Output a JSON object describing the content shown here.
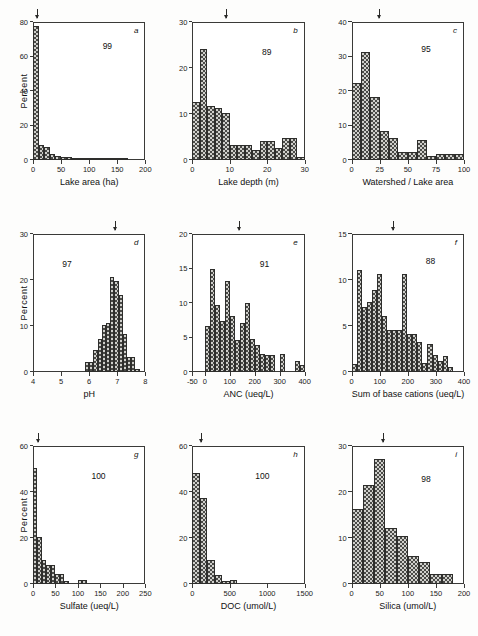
{
  "figure": {
    "type": "multi-panel-histogram-figure",
    "panels": 9
  },
  "chart_data": [
    {
      "type": "bar",
      "panel": "a",
      "panel_label": "a",
      "n_label": "99",
      "title": "",
      "xlabel": "Lake area (ha)",
      "ylabel": "Percent",
      "xlim": [
        0,
        200
      ],
      "ylim": [
        0,
        80
      ],
      "xticks": [
        0,
        50,
        100,
        150,
        200
      ],
      "yticks": [
        0,
        20,
        40,
        60,
        80
      ],
      "bin_width": 10,
      "grid": false,
      "median_marker": 8,
      "bin_starts": [
        0,
        10,
        20,
        30,
        40,
        50,
        60,
        70,
        80,
        90,
        100,
        110,
        120,
        130,
        140,
        150,
        160,
        170,
        180,
        190
      ],
      "values": [
        77,
        8,
        7,
        3,
        1.5,
        1,
        1,
        0.5,
        0.5,
        0.5,
        0.5,
        0.5,
        0.5,
        0.5,
        0.5,
        0.5,
        0.5,
        0,
        0,
        0
      ]
    },
    {
      "type": "bar",
      "panel": "b",
      "panel_label": "b",
      "n_label": "89",
      "title": "",
      "xlabel": "Lake depth (m)",
      "ylabel": "",
      "xlim": [
        0,
        30
      ],
      "ylim": [
        0,
        30
      ],
      "xticks": [
        0,
        10,
        20,
        30
      ],
      "yticks": [
        0,
        10,
        20,
        30
      ],
      "bin_width": 2,
      "grid": false,
      "median_marker": 9,
      "bin_starts": [
        0,
        2,
        4,
        6,
        8,
        10,
        12,
        14,
        16,
        18,
        20,
        22,
        24,
        26,
        28
      ],
      "values": [
        12.5,
        24,
        11.5,
        11,
        10,
        3,
        3,
        3,
        2,
        4,
        4,
        2.5,
        4.5,
        4.5,
        0.5
      ]
    },
    {
      "type": "bar",
      "panel": "c",
      "panel_label": "c",
      "n_label": "95",
      "title": "",
      "xlabel": "Watershed / Lake area",
      "ylabel": "",
      "xlim": [
        0,
        100
      ],
      "ylim": [
        0,
        40
      ],
      "xticks": [
        0,
        25,
        50,
        75,
        100
      ],
      "yticks": [
        0,
        10,
        20,
        30,
        40
      ],
      "bin_width": 8.33,
      "grid": false,
      "median_marker": 25,
      "bin_starts": [
        0,
        8.33,
        16.67,
        25,
        33.33,
        41.67,
        50,
        58.33,
        66.67,
        75,
        83.33,
        91.67
      ],
      "values": [
        22,
        31,
        18,
        8,
        6,
        2,
        2,
        5.5,
        1,
        1.5,
        1.5,
        1.5
      ]
    },
    {
      "type": "bar",
      "panel": "d",
      "panel_label": "d",
      "n_label": "97",
      "title": "",
      "xlabel": "pH",
      "ylabel": "Percent",
      "xlim": [
        4,
        8
      ],
      "ylim": [
        0,
        30
      ],
      "xticks": [
        4,
        5,
        6,
        7,
        8
      ],
      "yticks": [
        0,
        10,
        20,
        30
      ],
      "bin_width": 0.15,
      "grid": false,
      "median_marker": 6.95,
      "bin_starts": [
        5.85,
        6.0,
        6.15,
        6.3,
        6.45,
        6.6,
        6.75,
        6.9,
        7.05,
        7.2,
        7.35,
        7.5,
        7.65
      ],
      "values": [
        2,
        2,
        4.5,
        7,
        10,
        10.5,
        20.5,
        19.5,
        16.5,
        8,
        3,
        3,
        0.5
      ]
    },
    {
      "type": "bar",
      "panel": "e",
      "panel_label": "e",
      "n_label": "91",
      "title": "",
      "xlabel": "ANC (ueq/L)",
      "ylabel": "",
      "xlim": [
        -50,
        400
      ],
      "ylim": [
        0,
        20
      ],
      "xticks": [
        -50,
        0,
        100,
        200,
        300,
        400
      ],
      "yticks": [
        0,
        5,
        10,
        15,
        20
      ],
      "bin_width": 20,
      "grid": false,
      "median_marker": 140,
      "bin_starts": [
        0,
        20,
        40,
        60,
        80,
        100,
        120,
        140,
        160,
        180,
        200,
        220,
        240,
        260,
        280,
        300,
        320,
        340,
        360,
        380
      ],
      "values": [
        6.5,
        14.8,
        9.5,
        7.2,
        13,
        8,
        4.5,
        7,
        9.8,
        4.7,
        3.8,
        2.5,
        2.3,
        2.3,
        0,
        2.5,
        0,
        0,
        1.5,
        0.8
      ]
    },
    {
      "type": "bar",
      "panel": "f",
      "panel_label": "f",
      "n_label": "88",
      "title": "",
      "xlabel": "Sum of base cations (ueq/L)",
      "ylabel": "",
      "xlim": [
        0,
        400
      ],
      "ylim": [
        0,
        15
      ],
      "xticks": [
        0,
        100,
        200,
        300,
        400
      ],
      "yticks": [
        0,
        5,
        10,
        15
      ],
      "bin_width": 18,
      "grid": false,
      "median_marker": 150,
      "bin_starts": [
        0,
        18,
        36,
        54,
        72,
        90,
        108,
        126,
        144,
        162,
        180,
        198,
        216,
        234,
        252,
        270,
        288,
        306,
        324,
        342
      ],
      "values": [
        0.8,
        11,
        7,
        7.5,
        8.8,
        10.5,
        6,
        4.5,
        4.5,
        4.5,
        10.5,
        4,
        4,
        3.2,
        0.9,
        2.9,
        1.7,
        1.1,
        1.6,
        0.4
      ]
    },
    {
      "type": "bar",
      "panel": "g",
      "panel_label": "g",
      "n_label": "100",
      "title": "",
      "xlabel": "Sulfate (ueq/L)",
      "ylabel": "Percent",
      "xlim": [
        0,
        250
      ],
      "ylim": [
        0,
        60
      ],
      "xticks": [
        0,
        50,
        100,
        150,
        200,
        250
      ],
      "yticks": [
        0,
        20,
        40,
        60
      ],
      "bin_width": 10,
      "grid": false,
      "median_marker": 12,
      "bin_starts": [
        0,
        10,
        20,
        30,
        40,
        50,
        60,
        70,
        80,
        90,
        100,
        110,
        120,
        130,
        140,
        150,
        160,
        170,
        180,
        190
      ],
      "values": [
        50,
        20,
        10,
        8,
        8,
        4,
        4,
        1,
        0,
        0,
        1.5,
        1.5,
        0,
        0,
        0,
        0,
        0,
        0,
        0,
        0
      ]
    },
    {
      "type": "bar",
      "panel": "h",
      "panel_label": "h",
      "n_label": "100",
      "title": "",
      "xlabel": "DOC (umol/L)",
      "ylabel": "",
      "xlim": [
        0,
        1500
      ],
      "ylim": [
        0,
        60
      ],
      "xticks": [
        0,
        500,
        1000,
        1500
      ],
      "yticks": [
        0,
        20,
        40,
        60
      ],
      "bin_width": 100,
      "grid": false,
      "median_marker": 120,
      "bin_starts": [
        0,
        100,
        200,
        300,
        400,
        500,
        600,
        700,
        800,
        900,
        1000,
        1100,
        1200,
        1300,
        1400
      ],
      "values": [
        48,
        37,
        10,
        3.5,
        1,
        1.5,
        0,
        0,
        0,
        0,
        0,
        0,
        0,
        0,
        0
      ]
    },
    {
      "type": "bar",
      "panel": "i",
      "panel_label": "i",
      "n_label": "98",
      "title": "",
      "xlabel": "Silica (umol/L)",
      "ylabel": "",
      "xlim": [
        0,
        200
      ],
      "ylim": [
        0,
        30
      ],
      "xticks": [
        0,
        50,
        100,
        150,
        200
      ],
      "yticks": [
        0,
        10,
        20,
        30
      ],
      "bin_width": 20,
      "grid": false,
      "median_marker": 57,
      "bin_starts": [
        0,
        20,
        40,
        60,
        80,
        100,
        120,
        140,
        160
      ],
      "values": [
        16,
        21.3,
        27,
        12,
        10.3,
        5.8,
        4.6,
        1.9,
        1.9
      ]
    }
  ]
}
